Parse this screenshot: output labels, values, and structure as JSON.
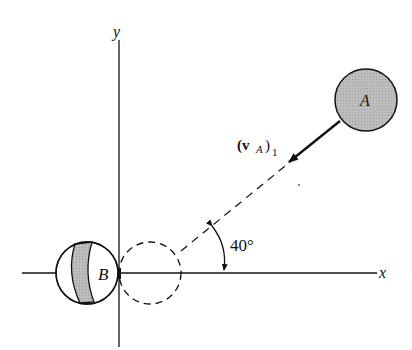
{
  "diagram": {
    "type": "collision-physics",
    "axes": {
      "x_label": "x",
      "y_label": "y"
    },
    "ball_a": {
      "label": "A",
      "fill": "#b8b8b8"
    },
    "ball_b": {
      "label": "B",
      "band_fill": "#b8b8b8"
    },
    "velocity": {
      "label_main": "(v",
      "label_sub": "A",
      "label_close": ")",
      "label_index": "1"
    },
    "angle": {
      "label": "40°",
      "degrees": 40
    },
    "colors": {
      "stroke": "#111111",
      "shade": "#b8b8b8",
      "background": "#ffffff"
    }
  }
}
